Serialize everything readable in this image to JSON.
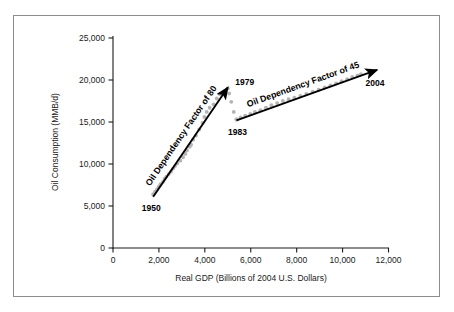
{
  "figure": {
    "border_color": "#8d8d8d",
    "background": "#ffffff"
  },
  "chart_data": {
    "type": "scatter",
    "title": "",
    "subtitle": "",
    "xlabel": "Real GDP (Billions of 2004 U.S. Dollars)",
    "ylabel": "Oil Consumption (MMB/d)",
    "xlim": [
      0,
      12000
    ],
    "ylim": [
      0,
      25000
    ],
    "xticks": [
      0,
      2000,
      4000,
      6000,
      8000,
      10000,
      12000
    ],
    "xticklabels": [
      "0",
      "2,000",
      "4,000",
      "6,000",
      "8,000",
      "10,000",
      "12,000"
    ],
    "yticks": [
      0,
      5000,
      10000,
      15000,
      20000,
      25000
    ],
    "yticklabels": [
      "0",
      "5,000",
      "10,000",
      "15,000",
      "20,000",
      "25,000"
    ],
    "grid": false,
    "legend": false,
    "point_color": "#b4b4b4",
    "trend_color": "#000000",
    "series": [
      {
        "name": "1950-1979",
        "x": [
          1750,
          1830,
          1920,
          1990,
          2070,
          2180,
          2250,
          2330,
          2430,
          2530,
          2620,
          2700,
          2800,
          2930,
          3050,
          3150,
          3220,
          3340,
          3400,
          3490,
          3610,
          3760,
          3900,
          3980,
          4080,
          4210,
          4380,
          4520,
          4660,
          4880
        ],
        "y": [
          6400,
          6700,
          7000,
          7300,
          7600,
          7900,
          8250,
          8500,
          8800,
          9100,
          9450,
          9750,
          10050,
          10400,
          10800,
          11200,
          11600,
          12050,
          12300,
          12900,
          13400,
          14100,
          14900,
          15600,
          16200,
          16700,
          17100,
          17800,
          18300,
          18700
        ]
      },
      {
        "name": "1979-1983",
        "x": [
          5000,
          5060,
          5150,
          5260,
          5380
        ],
        "y": [
          19000,
          18400,
          17400,
          16200,
          15300
        ]
      },
      {
        "name": "1983-2004",
        "x": [
          5380,
          5560,
          5760,
          5980,
          6180,
          6420,
          6660,
          6900,
          7150,
          7400,
          7650,
          7900,
          8160,
          8420,
          8700,
          8960,
          9220,
          9470,
          9720,
          9960,
          10200,
          10420,
          10650,
          10800
        ],
        "y": [
          15300,
          15550,
          15750,
          15950,
          16200,
          16400,
          16700,
          17000,
          17250,
          17500,
          17700,
          17900,
          18100,
          18350,
          18600,
          18850,
          19100,
          19350,
          19600,
          19850,
          20100,
          20350,
          20550,
          20700
        ]
      }
    ],
    "trend_arrows": [
      {
        "name": "oil-dependency-factor-80",
        "label": "Oil Dependency Factor of 80",
        "from": [
          1750,
          6100
        ],
        "to": [
          5000,
          19100
        ],
        "label_rotation": -56
      },
      {
        "name": "oil-dependency-factor-45",
        "label": "Oil Dependency Factor of 45",
        "from": [
          5380,
          15200
        ],
        "to": [
          11500,
          21200
        ],
        "label_rotation": -18
      }
    ],
    "annotations": [
      {
        "name": "year-1950",
        "text": "1950",
        "x": 1750,
        "y": 6100,
        "anchor": "end-below"
      },
      {
        "name": "year-1979",
        "text": "1979",
        "x": 5000,
        "y": 19000,
        "anchor": "right-above"
      },
      {
        "name": "year-1983",
        "text": "1983",
        "x": 5380,
        "y": 15300,
        "anchor": "below"
      },
      {
        "name": "year-2004",
        "text": "2004",
        "x": 10800,
        "y": 20700,
        "anchor": "below-right"
      }
    ]
  }
}
